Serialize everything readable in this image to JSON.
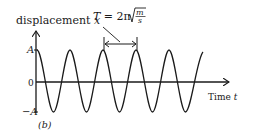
{
  "diagram": {
    "type": "simple-harmonic-motion-graph",
    "y_axis": {
      "label": "displacement",
      "variable": "x"
    },
    "x_axis": {
      "label": "Time",
      "variable": "t"
    },
    "y_ticks": {
      "top": "A",
      "zero": "0",
      "bottom": "−A"
    },
    "period_formula": {
      "lhs": "T",
      "eq": " = 2π",
      "num": "m",
      "den": "s"
    },
    "panel_label": "(b)",
    "curve": {
      "shape": "cosine",
      "cycles_shown": 5.0,
      "color": "#1a1a1a"
    }
  },
  "colors": {
    "ink": "#1a1a1a",
    "background": "#ffffff"
  }
}
